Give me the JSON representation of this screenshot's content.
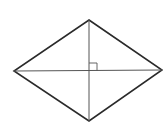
{
  "diagram": {
    "type": "rhombus-with-diagonals",
    "canvas": {
      "width": 163,
      "height": 123,
      "background": "#ffffff"
    },
    "vertices": {
      "top": [
        89,
        20
      ],
      "right": [
        162,
        70
      ],
      "bottom": [
        89,
        121
      ],
      "left": [
        14,
        71
      ]
    },
    "diagonals": {
      "horizontal": {
        "from": [
          14,
          71
        ],
        "to": [
          162,
          70
        ]
      },
      "vertical": {
        "from": [
          89,
          20
        ],
        "to": [
          89,
          121
        ]
      }
    },
    "intersection": [
      89,
      71
    ],
    "right_angle_marker": {
      "x": 89,
      "y": 63,
      "size": 8,
      "position": "upper-right"
    },
    "colors": {
      "outline": "#2a2a2a",
      "diagonal": "#555555",
      "marker": "#555555"
    },
    "stroke_widths": {
      "outline": 1.6,
      "diagonal": 1.0,
      "marker": 0.9
    }
  }
}
